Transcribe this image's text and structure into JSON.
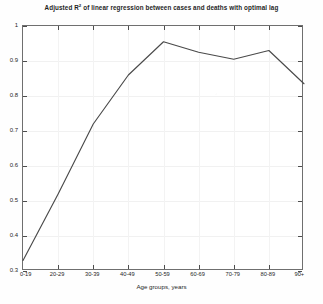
{
  "chart_data": {
    "type": "line",
    "title": "Adjusted R2 of linear regression between cases and deaths with optimal lag",
    "title_prefix": "Adjusted R",
    "title_superscript": "2",
    "title_suffix": " of linear regression between cases and deaths with optimal lag",
    "xlabel": "Age groups, years",
    "ylabel": "",
    "categories": [
      "0-19",
      "20-29",
      "30-39",
      "40-49",
      "50-59",
      "60-69",
      "70-79",
      "80-89",
      "90+"
    ],
    "values": [
      0.33,
      0.52,
      0.72,
      0.86,
      0.955,
      0.925,
      0.905,
      0.93,
      0.835
    ],
    "series": [
      {
        "name": "Adjusted R2",
        "values": [
          0.33,
          0.52,
          0.72,
          0.86,
          0.955,
          0.925,
          0.905,
          0.93,
          0.835
        ]
      }
    ],
    "ylim": [
      0.3,
      1.0
    ],
    "yticks": [
      0.3,
      0.4,
      0.5,
      0.6,
      0.7,
      0.8,
      0.9,
      1
    ],
    "ytick_labels": [
      "0.3",
      "0.4",
      "0.5",
      "0.6",
      "0.7",
      "0.8",
      "0.9",
      "1"
    ],
    "xtick_labels": [
      "0-19",
      "20-29",
      "30-39",
      "40-49",
      "50-59",
      "60-69",
      "70-79",
      "80-89",
      "90+"
    ],
    "grid": true,
    "legend": false,
    "legend_position": "none",
    "line_color": "#4a4a4a",
    "axis_color": "#6f6f6f",
    "background_color": "#ffffff"
  }
}
